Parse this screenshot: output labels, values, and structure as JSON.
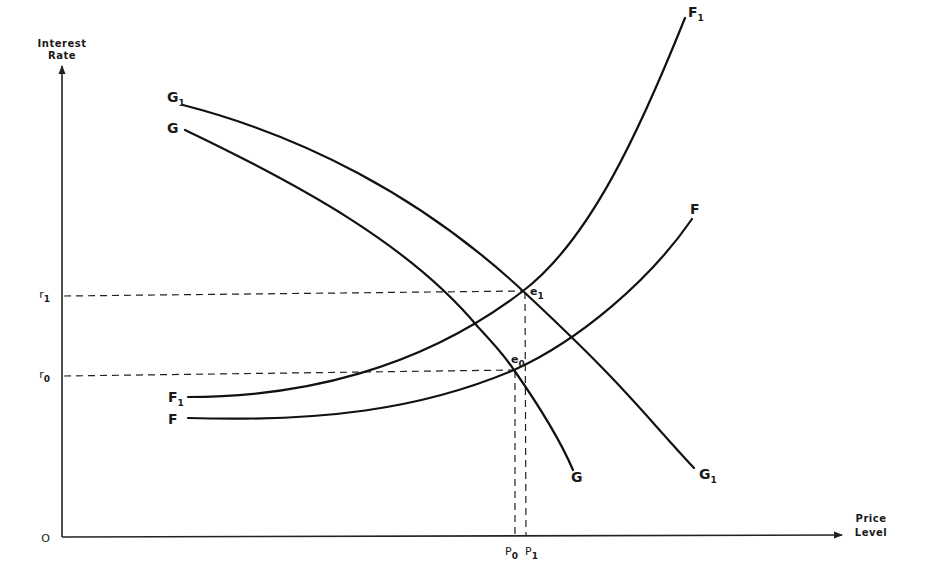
{
  "axes": {
    "y_title_line1": "Interest",
    "y_title_line2": "Rate",
    "x_title_line1": "Price",
    "x_title_line2": "Level",
    "origin": "O"
  },
  "curves": {
    "G1": {
      "name": "G",
      "sub": "1",
      "description": "shifted G curve (downward sloping)"
    },
    "G": {
      "name": "G",
      "sub": "",
      "description": "original G curve (downward sloping)"
    },
    "F1": {
      "name": "F",
      "sub": "1",
      "description": "shifted F curve (upward sloping)"
    },
    "F": {
      "name": "F",
      "sub": "",
      "description": "original F curve (upward sloping)"
    }
  },
  "points": {
    "e1": {
      "name": "e",
      "sub": "1"
    },
    "e0": {
      "name": "e",
      "sub": "0"
    }
  },
  "y_ticks": {
    "r1": {
      "name": "r",
      "sub": "1"
    },
    "r0": {
      "name": "r",
      "sub": "0"
    }
  },
  "x_ticks": {
    "p0": {
      "name": "P",
      "sub": "0"
    },
    "p1": {
      "name": "P",
      "sub": "1"
    }
  },
  "colors": {
    "ink": "#111111",
    "background": "#ffffff"
  }
}
